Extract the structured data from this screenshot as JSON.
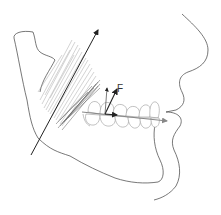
{
  "diagram": {
    "labels": {
      "force": "F"
    },
    "elements": [
      "mandible-outline",
      "facial-profile",
      "masseter-muscle-fibers",
      "muscle-line-of-action-arrow",
      "upper-teeth",
      "lower-teeth",
      "occlusal-plane-arrow",
      "force-vector-F",
      "vertical-force-component"
    ],
    "colors": {
      "outline": "#555555",
      "muscle": "#9a9a9a",
      "muscle_line": "#222222",
      "occlusal_arrow": "#888888",
      "force_arrow": "#222222",
      "background": "#ffffff"
    }
  }
}
